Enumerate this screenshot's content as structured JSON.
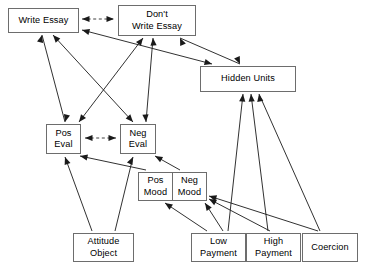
{
  "diagram": {
    "canvas": {
      "width": 368,
      "height": 266,
      "background": "#ffffff"
    },
    "style": {
      "node_border": "#6d6d6d",
      "node_fill": "#ffffff",
      "edge_color": "#1a1a1a",
      "text_color": "#000000"
    },
    "nodes": [
      {
        "id": "write_essay",
        "label": "Write Essay",
        "x": 8,
        "y": 8,
        "w": 71,
        "h": 25
      },
      {
        "id": "dont_write",
        "label": "Don't\nWrite Essay",
        "x": 118,
        "y": 5,
        "w": 78,
        "h": 31
      },
      {
        "id": "hidden_units",
        "label": "Hidden Units",
        "x": 200,
        "y": 66,
        "w": 96,
        "h": 26
      },
      {
        "id": "pos_eval",
        "label": "Pos\nEval",
        "x": 46,
        "y": 124,
        "w": 35,
        "h": 30
      },
      {
        "id": "neg_eval",
        "label": "Neg\nEval",
        "x": 120,
        "y": 124,
        "w": 36,
        "h": 30
      },
      {
        "id": "pos_mood",
        "label": "Pos\nMood",
        "x": 138,
        "y": 172,
        "w": 35,
        "h": 29
      },
      {
        "id": "neg_mood",
        "label": "Neg\nMood",
        "x": 172,
        "y": 172,
        "w": 35,
        "h": 29
      },
      {
        "id": "attitude_obj",
        "label": "Attitude\nObject",
        "x": 73,
        "y": 233,
        "w": 61,
        "h": 29
      },
      {
        "id": "low_payment",
        "label": "Low\nPayment",
        "x": 191,
        "y": 233,
        "w": 55,
        "h": 29
      },
      {
        "id": "high_payment",
        "label": "High\nPayment",
        "x": 246,
        "y": 233,
        "w": 55,
        "h": 29
      },
      {
        "id": "coercion",
        "label": "Coercion",
        "x": 302,
        "y": 233,
        "w": 56,
        "h": 29
      }
    ],
    "edges": [
      {
        "id": "e-we-dwe",
        "from": "write_essay",
        "to": "dont_write",
        "type": "dashed",
        "arrows": "both",
        "path": "M 82,19 L 114,19",
        "heads": [
          [
            82,
            19,
            180
          ],
          [
            114,
            19,
            0
          ]
        ]
      },
      {
        "id": "e-poseval-negeval",
        "from": "pos_eval",
        "to": "neg_eval",
        "type": "dashed",
        "arrows": "both",
        "path": "M 85,138 L 116,138",
        "heads": [
          [
            85,
            138,
            180
          ],
          [
            116,
            138,
            0
          ]
        ]
      },
      {
        "id": "e-we-poseval",
        "from": "write_essay",
        "to": "pos_eval",
        "type": "solid",
        "arrows": "both",
        "path": "M 42,35 L 65,122",
        "heads": [
          [
            42,
            35,
            285
          ],
          [
            65,
            122,
            105
          ]
        ]
      },
      {
        "id": "e-we-negeval",
        "from": "write_essay",
        "to": "neg_eval",
        "type": "solid",
        "arrows": "both",
        "path": "M 53,35 L 133,122",
        "heads": [
          [
            53,
            35,
            228
          ],
          [
            133,
            122,
            48
          ]
        ]
      },
      {
        "id": "e-dwe-poseval",
        "from": "dont_write",
        "to": "pos_eval",
        "type": "solid",
        "arrows": "both",
        "path": "M 143,38 L 79,122",
        "heads": [
          [
            143,
            38,
            307
          ],
          [
            79,
            122,
            127
          ]
        ]
      },
      {
        "id": "e-dwe-negeval",
        "from": "dont_write",
        "to": "neg_eval",
        "type": "solid",
        "arrows": "both",
        "path": "M 153,38 L 146,122",
        "heads": [
          [
            153,
            38,
            266
          ],
          [
            146,
            122,
            86
          ]
        ]
      },
      {
        "id": "e-we-hidden",
        "from": "write_essay",
        "to": "hidden_units",
        "type": "solid",
        "arrows": "both",
        "path": "M 82,30 L 212,64",
        "heads": [
          [
            82,
            30,
            195
          ],
          [
            212,
            64,
            15
          ]
        ]
      },
      {
        "id": "e-dwe-hidden",
        "from": "dont_write",
        "to": "hidden_units",
        "type": "solid",
        "arrows": "both",
        "path": "M 180,38 L 240,64",
        "heads": [
          [
            180,
            38,
            246
          ],
          [
            240,
            64,
            66
          ]
        ]
      },
      {
        "id": "e-posmood-poseval",
        "from": "pos_mood",
        "to": "pos_eval",
        "type": "solid",
        "arrows": "to",
        "path": "M 146,170 L 80,156",
        "heads": [
          [
            80,
            156,
            192
          ]
        ]
      },
      {
        "id": "e-negmood-negeval",
        "from": "neg_mood",
        "to": "neg_eval",
        "type": "solid",
        "arrows": "to",
        "path": "M 180,170 L 155,156",
        "heads": [
          [
            155,
            156,
            209
          ]
        ]
      },
      {
        "id": "e-attitude-poseval",
        "from": "attitude_obj",
        "to": "pos_eval",
        "type": "solid",
        "arrows": "to",
        "path": "M 92,231 L 65,157",
        "heads": [
          [
            65,
            157,
            250
          ]
        ]
      },
      {
        "id": "e-attitude-negeval",
        "from": "attitude_obj",
        "to": "neg_eval",
        "type": "solid",
        "arrows": "to",
        "path": "M 115,231 L 133,157",
        "heads": [
          [
            133,
            157,
            296
          ]
        ]
      },
      {
        "id": "e-low-posmood",
        "from": "low_payment",
        "to": "pos_mood",
        "type": "solid",
        "arrows": "to",
        "path": "M 207,231 L 165,203",
        "heads": [
          [
            165,
            203,
            214
          ]
        ]
      },
      {
        "id": "e-low-negmood",
        "from": "low_payment",
        "to": "neg_mood",
        "type": "solid",
        "arrows": "to",
        "path": "M 223,231 L 205,203",
        "heads": [
          [
            205,
            203,
            236
          ]
        ]
      },
      {
        "id": "e-high-negmood",
        "from": "high_payment",
        "to": "neg_mood",
        "type": "solid",
        "arrows": "to",
        "path": "M 270,231 L 209,199",
        "heads": [
          [
            209,
            199,
            208
          ]
        ]
      },
      {
        "id": "e-coercion-negmood",
        "from": "coercion",
        "to": "neg_mood",
        "type": "solid",
        "arrows": "to",
        "path": "M 318,231 L 209,196",
        "heads": [
          [
            209,
            196,
            198
          ]
        ]
      },
      {
        "id": "e-low-hidden",
        "from": "low_payment",
        "to": "hidden_units",
        "type": "solid",
        "arrows": "to",
        "path": "M 228,231 L 243,94",
        "heads": [
          [
            243,
            94,
            276
          ]
        ]
      },
      {
        "id": "e-high-hidden",
        "from": "high_payment",
        "to": "hidden_units",
        "type": "solid",
        "arrows": "to",
        "path": "M 268,231 L 251,94",
        "heads": [
          [
            251,
            94,
            265
          ]
        ]
      },
      {
        "id": "e-coercion-hidden",
        "from": "coercion",
        "to": "hidden_units",
        "type": "solid",
        "arrows": "to",
        "path": "M 320,231 L 259,94",
        "heads": [
          [
            259,
            94,
            260
          ]
        ]
      }
    ]
  }
}
